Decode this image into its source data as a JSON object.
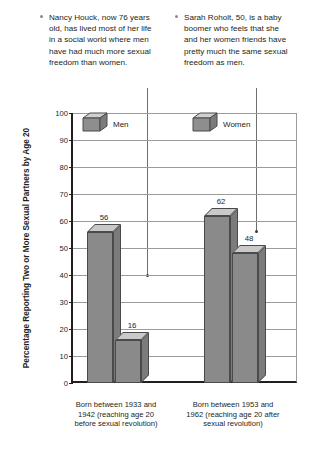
{
  "callouts": [
    {
      "id": "nancy-houck",
      "text": "Nancy Houck, now 76 years old, has lived most of her life in a social world where men have had much more sexual freedom than women."
    },
    {
      "id": "sarah-roholt",
      "text": "Sarah Roholt, 50, is a baby boomer who feels that she and her women friends have pretty much the same sexual freedom as men."
    }
  ],
  "chart_data": {
    "type": "bar",
    "title": "",
    "xlabel": "",
    "ylabel": "Percentage Reporting Two or More Sexual Partners by Age 20",
    "ylim": [
      0,
      100
    ],
    "ytick_step": 10,
    "yticks": [
      "100",
      "90",
      "80",
      "70",
      "60",
      "50",
      "40",
      "30",
      "20",
      "10",
      "0"
    ],
    "grid": true,
    "legend_position": "top-inside",
    "categories": [
      "Born between 1933 and 1942 (reaching age 20 before sexual revolution)",
      "Born between 1953 and 1962 (reaching age 20 after sexual revolution)"
    ],
    "series": [
      {
        "name": "Men",
        "values": [
          56,
          62
        ]
      },
      {
        "name": "Women",
        "values": [
          16,
          48
        ]
      }
    ],
    "colors": {
      "bar_front": "#8a8a8a",
      "bar_top": "#c9c9c9",
      "bar_side": "#7b7b7b",
      "bar_edge": "#4a4a4a",
      "axis": "#231f20",
      "grid": "#9b9b9b"
    }
  }
}
